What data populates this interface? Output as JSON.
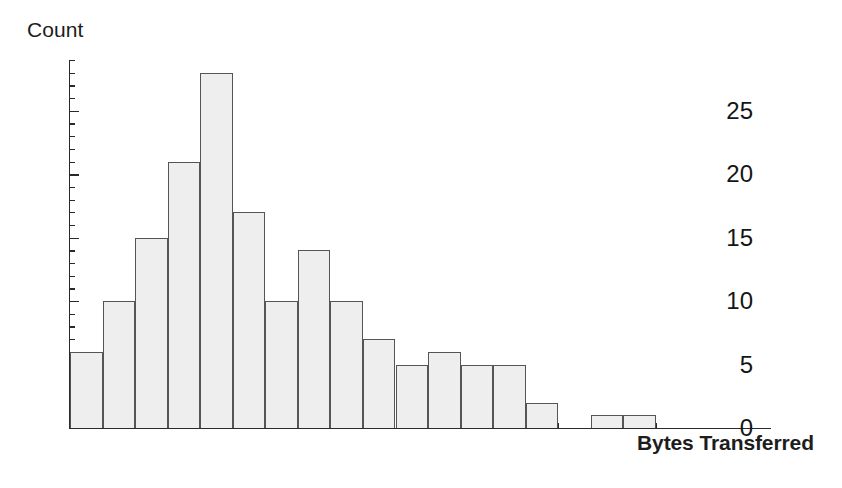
{
  "chart_data": {
    "type": "bar",
    "title": "",
    "subtitle": "",
    "xlabel": "Bytes Transferred",
    "ylabel": "Count",
    "grid": false,
    "legend": null,
    "xlim": [
      0,
      9000
    ],
    "ylim": [
      0,
      29
    ],
    "bin_width": 500,
    "x_major_ticks": [
      0,
      2000,
      4000,
      6000,
      8000
    ],
    "x_tick_labels": [
      "0",
      "2000",
      "4000",
      "6000",
      "8000"
    ],
    "x_minor_tick_step": 500,
    "y_major_ticks": [
      0,
      5,
      10,
      15,
      20,
      25
    ],
    "y_tick_labels": [
      "0",
      "5",
      "10",
      "15",
      "20",
      "25"
    ],
    "y_minor_tick_step": 1,
    "categories": [
      "0-500",
      "500-1000",
      "1000-1500",
      "1500-2000",
      "2000-2500",
      "2500-3000",
      "3000-3500",
      "3500-4000",
      "4000-4500",
      "4500-5000",
      "5000-5500",
      "5500-6000",
      "6000-6500",
      "6500-7000",
      "7000-7500",
      "7500-8000",
      "8000-8500",
      "8500-9000"
    ],
    "bin_starts": [
      0,
      500,
      1000,
      1500,
      2000,
      2500,
      3000,
      3500,
      4000,
      4500,
      5000,
      5500,
      6000,
      6500,
      7000,
      7500,
      8000,
      8500
    ],
    "values": [
      6,
      10,
      15,
      21,
      28,
      17,
      10,
      14,
      10,
      7,
      5,
      6,
      5,
      5,
      2,
      0,
      1,
      1
    ]
  },
  "colors": {
    "bar_fill": "#eeeeee",
    "bar_border": "#555555",
    "axis": "#2a2a2a",
    "text": "#151515",
    "background": "#ffffff"
  }
}
